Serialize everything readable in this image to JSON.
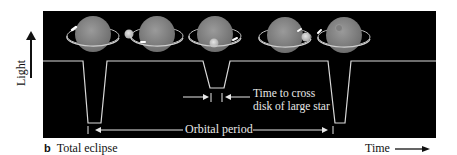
{
  "figure": {
    "panel_label": "b",
    "caption": "Total eclipse",
    "y_axis_label": "Light",
    "x_axis_label": "Time",
    "annotations": {
      "cross_time_line1": "Time to cross",
      "cross_time_line2": "disk of large star",
      "orbital_period": "Orbital period"
    },
    "colors": {
      "background": "#000000",
      "curve": "#d9d9d9",
      "large_star": "#8a8a8a",
      "small_star": "#c8c8c8",
      "orbit": "#bdbdbd"
    },
    "star_positions": [
      {
        "phase": "small star behind-left (transit start of primary eclipse)",
        "large_cx": 93,
        "small_cx": 64
      },
      {
        "phase": "small star left-front",
        "large_cx": 157,
        "small_cx": 130
      },
      {
        "phase": "small star in front of large star",
        "large_cx": 215,
        "small_cx": 215
      },
      {
        "phase": "small star right, emerging",
        "large_cx": 285,
        "small_cx": 306
      },
      {
        "phase": "small star behind large star",
        "large_cx": 344,
        "small_cx": 349
      }
    ],
    "light_curve": {
      "baseline": "high",
      "dips": [
        {
          "name": "primary eclipse",
          "depth": "deep",
          "x_start": 83,
          "x_end": 107
        },
        {
          "name": "secondary eclipse",
          "depth": "shallow",
          "x_start": 203,
          "x_end": 230
        },
        {
          "name": "primary eclipse",
          "depth": "deep",
          "x_start": 328,
          "x_end": 351
        }
      ]
    }
  }
}
